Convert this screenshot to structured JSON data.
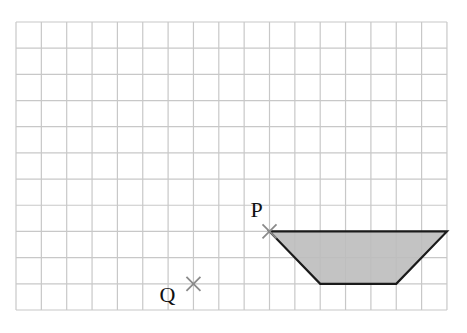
{
  "diagram": {
    "type": "grid-with-shape",
    "grid": {
      "columns": 17,
      "rows": 11,
      "origin_px": [
        16,
        22
      ],
      "cell_w": 25.35,
      "cell_h": 26.18,
      "line_color": "#c8c8c8"
    },
    "shape": {
      "name": "trapezium",
      "fill": "#bdbdbd",
      "stroke": "#1a1a1a",
      "vertices_grid": [
        [
          10,
          8
        ],
        [
          17,
          8
        ],
        [
          15,
          10
        ],
        [
          12,
          10
        ]
      ]
    },
    "points": [
      {
        "label": "P",
        "grid": [
          10,
          8
        ],
        "marker": "cross",
        "color": "#8a8a8a"
      },
      {
        "label": "Q",
        "grid": [
          7,
          10
        ],
        "marker": "cross",
        "color": "#8a8a8a"
      }
    ]
  }
}
